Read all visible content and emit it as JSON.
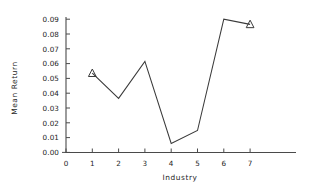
{
  "chart_data": {
    "type": "line",
    "title": "",
    "xlabel": "Industry",
    "ylabel": "Mean Return",
    "x": [
      1,
      2,
      3,
      4,
      5,
      6,
      7
    ],
    "values": [
      0.0535,
      0.0365,
      0.0615,
      0.006,
      0.0148,
      0.09,
      0.0865
    ],
    "series": [
      {
        "name": "Mean Return",
        "values": [
          0.0535,
          0.0365,
          0.0615,
          0.006,
          0.0148,
          0.09,
          0.0865
        ],
        "marker": "triangle",
        "marker_points": [
          1,
          7
        ]
      }
    ],
    "categories": [
      "1",
      "2",
      "3",
      "4",
      "5",
      "6",
      "7"
    ],
    "xlim": [
      0,
      8.7
    ],
    "ylim": [
      0.0,
      0.09
    ],
    "xticks": [
      0,
      1,
      2,
      3,
      4,
      5,
      6,
      7
    ],
    "xtick_labels": [
      "0",
      "1",
      "2",
      "3",
      "4",
      "5",
      "6",
      "7"
    ],
    "yticks": [
      0.0,
      0.01,
      0.02,
      0.03,
      0.04,
      0.05,
      0.06,
      0.07,
      0.08,
      0.09
    ],
    "ytick_labels": [
      "0.00",
      "0.01",
      "0.02",
      "0.03",
      "0.04",
      "0.05",
      "0.06",
      "0.07",
      "0.08",
      "0.09"
    ],
    "grid": false,
    "legend": false,
    "legend_position": "none",
    "line_color": "#3a3a3a",
    "axis_color": "#4a4a4a",
    "background_color": "#ffffff"
  }
}
